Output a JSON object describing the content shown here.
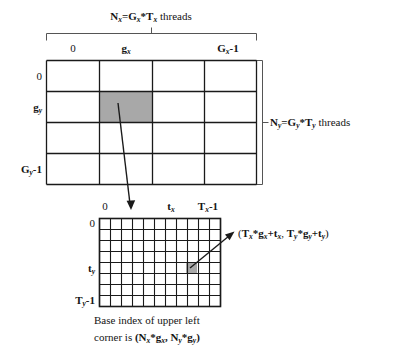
{
  "figure": {
    "title_top": "Nx=Gx*Tx threads",
    "grid_block": {
      "name": "grid-of-blocks",
      "col_labels": [
        "0",
        "gx",
        "Gx-1"
      ],
      "row_labels": [
        "0",
        "gy",
        "Gy-1"
      ],
      "cols": 4,
      "rows": 4,
      "highlight": {
        "col": 1,
        "row": 1
      }
    },
    "grid_thread": {
      "name": "block-of-threads",
      "col_labels": [
        "0",
        "tx",
        "Tx-1"
      ],
      "row_labels": [
        "0",
        "ty",
        "Ty-1"
      ],
      "cols": 11,
      "rows": 8,
      "highlight": {
        "col": 8,
        "row": 4
      }
    },
    "label_top": {
      "n": "N",
      "n_sub": "x",
      "eq": "=",
      "g": "G",
      "g_sub": "x",
      "star": "*",
      "t": "T",
      "t_sub": "x",
      "tail": " threads"
    },
    "label_right": {
      "n": "N",
      "n_sub": "y",
      "eq": "=",
      "g": "G",
      "g_sub": "y",
      "star": "*",
      "t": "T",
      "t_sub": "y",
      "tail": " threads"
    },
    "annotation_index": "(Tx*gx+tx, Ty*gy+ty)",
    "caption_line1": "Base index of upper left",
    "caption_line2": "corner is (Nx*gx, Ny*gy)",
    "colors": {
      "line": "#1a1a1a",
      "highlight_fill": "#a8a8a8",
      "bracket": "#555555",
      "background": "#ffffff"
    }
  }
}
